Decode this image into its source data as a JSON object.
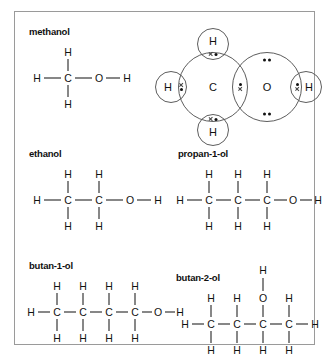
{
  "figure": {
    "border_color": "#9a9a9a",
    "background": "#ffffff"
  },
  "molecules": [
    {
      "id": "methanol",
      "label": "methanol",
      "carbon_count": 1,
      "oh_position": 1,
      "displayed_formula": "H-CH2-OH",
      "atoms": {
        "chain": [
          "H",
          "C",
          "O",
          "H"
        ],
        "top_hydrogens": [
          "H"
        ],
        "bottom_hydrogens": [
          "H"
        ]
      }
    },
    {
      "id": "ethanol",
      "label": "ethanol",
      "carbon_count": 2,
      "oh_position": 1,
      "displayed_formula": "H-CH2-CH2-OH",
      "atoms": {
        "chain": [
          "H",
          "C",
          "C",
          "O",
          "H"
        ],
        "top_hydrogens": [
          "H",
          "H"
        ],
        "bottom_hydrogens": [
          "H",
          "H"
        ]
      }
    },
    {
      "id": "propan-1-ol",
      "label": "propan-1-ol",
      "carbon_count": 3,
      "oh_position": 1,
      "displayed_formula": "H-CH2-CH2-CH2-OH",
      "atoms": {
        "chain": [
          "H",
          "C",
          "C",
          "C",
          "O",
          "H"
        ],
        "top_hydrogens": [
          "H",
          "H",
          "H"
        ],
        "bottom_hydrogens": [
          "H",
          "H",
          "H"
        ]
      }
    },
    {
      "id": "butan-1-ol",
      "label": "butan-1-ol",
      "carbon_count": 4,
      "oh_position": 1,
      "displayed_formula": "H-CH2-CH2-CH2-CH2-OH",
      "atoms": {
        "chain": [
          "H",
          "C",
          "C",
          "C",
          "C",
          "O",
          "H"
        ],
        "top_hydrogens": [
          "H",
          "H",
          "H",
          "H"
        ],
        "bottom_hydrogens": [
          "H",
          "H",
          "H",
          "H"
        ]
      }
    },
    {
      "id": "butan-2-ol",
      "label": "butan-2-ol",
      "carbon_count": 4,
      "oh_position": 3,
      "displayed_formula": "H-CH2-CH2-CH(OH)-CH2-H",
      "atoms": {
        "chain": [
          "H",
          "C",
          "C",
          "C",
          "C",
          "H"
        ],
        "top_hydrogens": [
          "H",
          "H",
          "O",
          "H"
        ],
        "bottom_hydrogens": [
          "H",
          "H",
          "H",
          "H"
        ],
        "hydroxyl_hydrogen": "H"
      }
    }
  ],
  "dot_cross": {
    "molecule": "methanol",
    "carbon_label": "C",
    "oxygen_label": "O",
    "hydrogen_label": "H",
    "hydrogen_count": 4,
    "bonding_pairs": 5,
    "oxygen_lone_pairs": 2,
    "dot_symbol": "dot",
    "cross_symbol": "cross",
    "shell_color": "#5d5d5d",
    "electron_color": "#111111",
    "labels": {
      "carbon": "C",
      "oxygen": "O",
      "hydrogen_top": "H",
      "hydrogen_left": "H",
      "hydrogen_bottom": "H",
      "hydrogen_right": "H"
    }
  }
}
